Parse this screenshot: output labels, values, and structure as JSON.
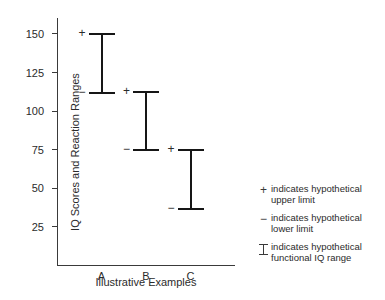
{
  "chart_data": {
    "type": "bar",
    "subtype": "range-interval",
    "title": "",
    "xlabel": "Illustrative Examples",
    "ylabel": "IQ Scores and Reaction Ranges",
    "categories": [
      "A",
      "B",
      "C"
    ],
    "ylim": [
      0,
      160
    ],
    "yticks": [
      25,
      50,
      75,
      100,
      125,
      150
    ],
    "ytick_labels": [
      "25",
      "50",
      "75",
      "100",
      "125",
      "150"
    ],
    "grid": false,
    "legend_position": "right",
    "series": [
      {
        "name": "lower limit",
        "values": [
          112,
          75,
          37
        ]
      },
      {
        "name": "upper limit",
        "values": [
          150,
          112.5,
          75
        ]
      }
    ],
    "ranges": [
      {
        "category": "A",
        "lower": 112,
        "upper": 150
      },
      {
        "category": "B",
        "lower": 75,
        "upper": 112.5
      },
      {
        "category": "C",
        "lower": 37,
        "upper": 75
      }
    ],
    "marker_upper": "+",
    "marker_lower": "−"
  },
  "axes": {
    "y_title": "IQ Scores and Reaction Ranges",
    "x_title": "Illustrative Examples",
    "y_ticks": [
      {
        "value": 150,
        "label": "150"
      },
      {
        "value": 125,
        "label": "125"
      },
      {
        "value": 100,
        "label": "100"
      },
      {
        "value": 75,
        "label": "75"
      },
      {
        "value": 50,
        "label": "50"
      },
      {
        "value": 25,
        "label": "25"
      }
    ],
    "x_categories": [
      {
        "label": "A"
      },
      {
        "label": "B"
      },
      {
        "label": "C"
      }
    ]
  },
  "legend": {
    "items": [
      {
        "glyph": "+",
        "glyph_name": "plus-marker",
        "text": "indicates hypothetical\nupper limit"
      },
      {
        "glyph": "−",
        "glyph_name": "minus-marker",
        "text": "indicates hypothetical\nlower limit"
      },
      {
        "glyph": "I",
        "glyph_name": "ibeam-marker",
        "text": "indicates hypothetical\nfunctional IQ range"
      }
    ]
  },
  "colors": {
    "background": "#ffffff",
    "axis": "#3a3a3a",
    "beam": "#161616",
    "text": "#2b2b2b"
  }
}
